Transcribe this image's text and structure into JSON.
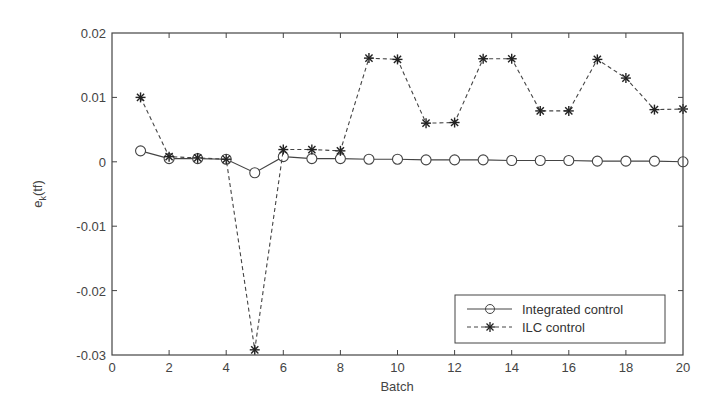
{
  "chart_data": {
    "type": "line",
    "title": "",
    "xlabel": "Batch",
    "ylabel": "e_k(tf)",
    "ylabel_main": "e",
    "ylabel_sub": "k",
    "ylabel_paren": "(tf)",
    "xlim": [
      0,
      20
    ],
    "ylim": [
      -0.03,
      0.02
    ],
    "grid": false,
    "legend_position": "lower right",
    "x_ticks": [
      0,
      2,
      4,
      6,
      8,
      10,
      12,
      14,
      16,
      18,
      20
    ],
    "x_tick_labels": [
      "0",
      "2",
      "4",
      "6",
      "8",
      "10",
      "12",
      "14",
      "16",
      "18",
      "20"
    ],
    "y_ticks": [
      0.02,
      0.01,
      0,
      -0.01,
      -0.02,
      -0.03
    ],
    "y_tick_labels": [
      "0.02",
      "0.01",
      "0",
      "-0.01",
      "-0.02",
      "-0.03"
    ],
    "x": [
      1,
      2,
      3,
      4,
      5,
      6,
      7,
      8,
      9,
      10,
      11,
      12,
      13,
      14,
      15,
      16,
      17,
      18,
      19,
      20
    ],
    "series": [
      {
        "name": "Integrated control",
        "line_style": "solid",
        "marker": "circle",
        "values": [
          0.0017,
          0.0005,
          0.0005,
          0.0004,
          -0.0017,
          0.0008,
          0.0005,
          0.0005,
          0.0004,
          0.0004,
          0.0003,
          0.0003,
          0.0003,
          0.0002,
          0.0002,
          0.0002,
          0.0001,
          0.0001,
          0.0001,
          0.0
        ]
      },
      {
        "name": "ILC control",
        "line_style": "dashed",
        "marker": "star",
        "values": [
          0.01,
          0.0008,
          0.0006,
          0.0004,
          -0.0292,
          0.0019,
          0.0019,
          0.0017,
          0.0161,
          0.0159,
          0.006,
          0.0061,
          0.016,
          0.016,
          0.0079,
          0.0079,
          0.0159,
          0.013,
          0.0081,
          0.0082
        ]
      }
    ]
  },
  "legend": {
    "items": [
      {
        "label": "Integrated control"
      },
      {
        "label": "ILC control"
      }
    ]
  }
}
